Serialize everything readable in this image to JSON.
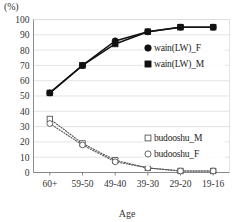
{
  "chart_data": {
    "type": "line",
    "title": "",
    "subtitle": "",
    "unit_label": "(%)",
    "xlabel": "Age",
    "ylabel": "",
    "categories": [
      "60+",
      "59-50",
      "49-40",
      "39-30",
      "29-20",
      "19-16"
    ],
    "ylim": [
      0,
      100
    ],
    "ytick_step": 10,
    "yticks": [
      0,
      10,
      20,
      30,
      40,
      50,
      60,
      70,
      80,
      90,
      100
    ],
    "ytick_labels": [
      "0",
      "10",
      "20",
      "30",
      "40",
      "50",
      "60",
      "70",
      "80",
      "90",
      "100"
    ],
    "grid": true,
    "grid_axis": "y",
    "legend_position": "inside-right",
    "series": [
      {
        "name": "wain(LW)_F",
        "marker": "filled-circle",
        "line": "solid",
        "color": "#111111",
        "values": [
          52,
          70,
          86,
          92,
          95,
          95
        ]
      },
      {
        "name": "wain(LW)_M",
        "marker": "filled-square",
        "line": "solid",
        "color": "#111111",
        "values": [
          52,
          70,
          84,
          92,
          95,
          95
        ]
      },
      {
        "name": "budooshu_M",
        "marker": "open-square",
        "line": "dotted",
        "color": "#555555",
        "values": [
          35,
          19,
          8,
          3,
          1,
          1
        ]
      },
      {
        "name": "budooshu_F",
        "marker": "open-circle",
        "line": "dotted",
        "color": "#555555",
        "values": [
          32,
          18,
          7,
          3,
          1,
          1
        ]
      }
    ]
  },
  "legend_upper": [
    {
      "label": "wain(LW)_F",
      "marker": "filled-circle"
    },
    {
      "label": "wain(LW)_M",
      "marker": "filled-square"
    }
  ],
  "legend_lower": [
    {
      "label": "budooshu_M",
      "marker": "open-square"
    },
    {
      "label": "budooshu_F",
      "marker": "open-circle"
    }
  ],
  "colors": {
    "series_dark": "#111111",
    "series_gray": "#555555",
    "gridline": "#d8d8d8",
    "axis": "#6e6e6e",
    "text": "#333333",
    "background": "#ffffff"
  }
}
